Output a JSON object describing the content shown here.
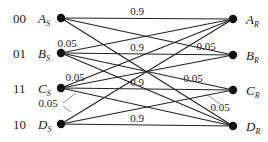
{
  "diagram": {
    "type": "bipartite-channel-transition",
    "senders": [
      {
        "id": "AS",
        "code": "00",
        "letter": "A",
        "sub": "S",
        "x": 61,
        "y": 18
      },
      {
        "id": "BS",
        "code": "01",
        "letter": "B",
        "sub": "S",
        "x": 61,
        "y": 53
      },
      {
        "id": "CS",
        "code": "11",
        "letter": "C",
        "sub": "S",
        "x": 61,
        "y": 88
      },
      {
        "id": "DS",
        "code": "10",
        "letter": "D",
        "sub": "S",
        "x": 61,
        "y": 124
      }
    ],
    "receivers": [
      {
        "id": "AR",
        "letter": "A",
        "sub": "R",
        "x": 233,
        "y": 19
      },
      {
        "id": "BR",
        "letter": "B",
        "sub": "R",
        "x": 233,
        "y": 55
      },
      {
        "id": "CR",
        "letter": "C",
        "sub": "R",
        "x": 233,
        "y": 90
      },
      {
        "id": "DR",
        "letter": "D",
        "sub": "R",
        "x": 233,
        "y": 126
      }
    ],
    "edges": [
      {
        "from": "AS",
        "to": "AR"
      },
      {
        "from": "AS",
        "to": "BR"
      },
      {
        "from": "AS",
        "to": "DR"
      },
      {
        "from": "BS",
        "to": "AR"
      },
      {
        "from": "BS",
        "to": "BR"
      },
      {
        "from": "BS",
        "to": "CR"
      },
      {
        "from": "BS",
        "to": "DR"
      },
      {
        "from": "CS",
        "to": "AR"
      },
      {
        "from": "CS",
        "to": "BR"
      },
      {
        "from": "CS",
        "to": "CR"
      },
      {
        "from": "CS",
        "to": "DR"
      },
      {
        "from": "DS",
        "to": "AR"
      },
      {
        "from": "DS",
        "to": "CR"
      },
      {
        "from": "DS",
        "to": "DR"
      }
    ],
    "labels": [
      {
        "text": "0.9",
        "x": 137,
        "y": 15
      },
      {
        "text": "0.9",
        "x": 137,
        "y": 51
      },
      {
        "text": "0.9",
        "x": 137,
        "y": 86
      },
      {
        "text": "0.9",
        "x": 137,
        "y": 122
      },
      {
        "text": "0.05",
        "x": 67,
        "y": 47
      },
      {
        "text": "0.05",
        "x": 206,
        "y": 50
      },
      {
        "text": "0.05",
        "x": 75,
        "y": 81
      },
      {
        "text": "0.05",
        "x": 193,
        "y": 82
      },
      {
        "text": "0.05",
        "x": 48,
        "y": 107
      },
      {
        "text": "0.05",
        "x": 220,
        "y": 111
      }
    ],
    "leaders": [
      {
        "x1": 63,
        "y1": 103,
        "x2": 76,
        "y2": 93
      },
      {
        "x1": 63,
        "y1": 106,
        "x2": 71,
        "y2": 112
      },
      {
        "x1": 206,
        "y1": 94,
        "x2": 220,
        "y2": 104
      }
    ]
  }
}
